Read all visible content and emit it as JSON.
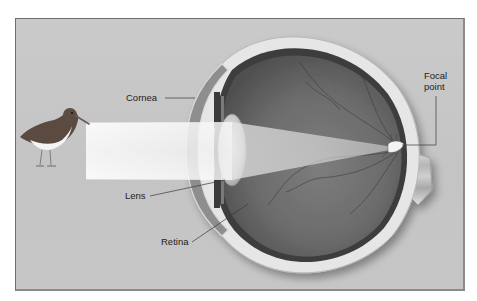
{
  "figure": {
    "labels": {
      "cornea": "Cornea",
      "lens": "Lens",
      "retina": "Retina",
      "focal_point_line1": "Focal",
      "focal_point_line2": "point"
    }
  },
  "colors": {
    "background": "#c6c6c6",
    "frame_border": "#6e6e6e",
    "eye_interior": "#6f6f6f",
    "sclera": "#e4e4e4",
    "choroid": "#3c3c3c",
    "light_beam": "#f4f4f4",
    "label_text": "#1e1e1e"
  }
}
